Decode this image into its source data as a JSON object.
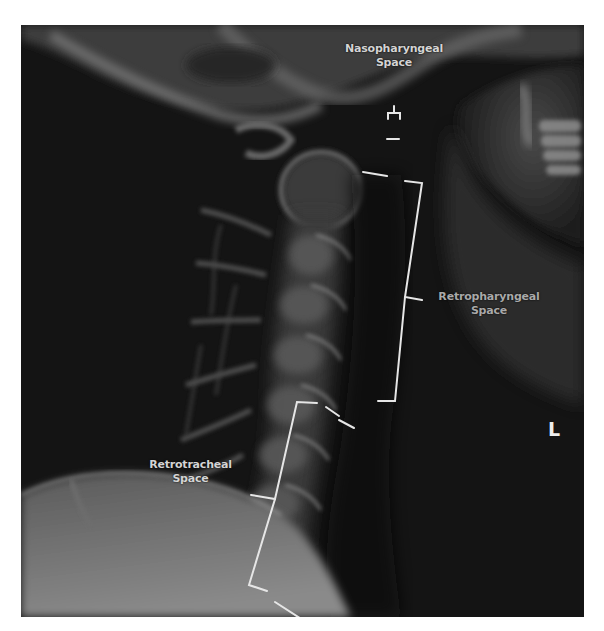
{
  "figure": {
    "type": "lateral cervical spine radiograph (inverted/annotated)",
    "background_color": "#ffffff",
    "image_background_color": "#141414",
    "annotation_color": "#e6e6e6"
  },
  "labels": {
    "nasopharyngeal": {
      "line1": "Nasopharyngeal",
      "line2": "Space"
    },
    "retropharyngeal": {
      "line1": "Retropharyngeal",
      "line2": "Space"
    },
    "retrotracheal": {
      "line1": "Retrotracheal",
      "line2": "Space"
    }
  },
  "orientation_marker": "L"
}
